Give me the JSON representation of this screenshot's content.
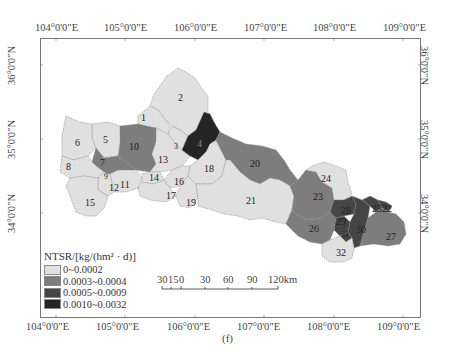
{
  "figure": {
    "caption": "(f)",
    "colors": {
      "class1": "#e0e0e0",
      "class2": "#7d7d7d",
      "class3": "#454545",
      "class4": "#252525",
      "frame": "#777777"
    }
  },
  "axes": {
    "top_lon": [
      "104°0'0\"E",
      "105°0'0\"E",
      "106°0'0\"E",
      "107°0'0\"E",
      "108°0'0\"E",
      "109°0'0\"E"
    ],
    "bottom_lon": [
      "104°0'0\"E",
      "105°0'0\"E",
      "106°0'0\"E",
      "107°0'0\"E",
      "108°0'0\"E",
      "109°0'0\"E"
    ],
    "left_lat": [
      "36°0'0\"N",
      "35°0'0\"N",
      "34°0'0\"N"
    ],
    "right_lat": [
      "36°0'0\"N",
      "35°0'0\"N",
      "34°0'0\"N"
    ]
  },
  "legend": {
    "title": "NTSR/[kg/(hm² · d)]",
    "items": [
      {
        "label": "0~0.0002",
        "color": "#e0e0e0"
      },
      {
        "label": "0.0003~0.0004",
        "color": "#7d7d7d"
      },
      {
        "label": "0.0005~0.0009",
        "color": "#454545"
      },
      {
        "label": "0.0010~0.0032",
        "color": "#252525"
      }
    ]
  },
  "scalebar": {
    "labels": [
      "30",
      "15",
      "0",
      "30",
      "60",
      "90",
      "120km"
    ]
  },
  "regions": [
    {
      "id": "1",
      "class": 1
    },
    {
      "id": "2",
      "class": 1
    },
    {
      "id": "3",
      "class": 1
    },
    {
      "id": "4",
      "class": 4
    },
    {
      "id": "5",
      "class": 1
    },
    {
      "id": "6",
      "class": 1
    },
    {
      "id": "7",
      "class": 2
    },
    {
      "id": "8",
      "class": 1
    },
    {
      "id": "9",
      "class": 3
    },
    {
      "id": "10",
      "class": 2
    },
    {
      "id": "11",
      "class": 1
    },
    {
      "id": "12",
      "class": 1
    },
    {
      "id": "13",
      "class": 1
    },
    {
      "id": "14",
      "class": 1
    },
    {
      "id": "15",
      "class": 1
    },
    {
      "id": "16",
      "class": 1
    },
    {
      "id": "17",
      "class": 1
    },
    {
      "id": "18",
      "class": 1
    },
    {
      "id": "19",
      "class": 1
    },
    {
      "id": "20",
      "class": 2
    },
    {
      "id": "21",
      "class": 1
    },
    {
      "id": "22",
      "class": 3
    },
    {
      "id": "23",
      "class": 2
    },
    {
      "id": "24",
      "class": 1
    },
    {
      "id": "25",
      "class": 3
    },
    {
      "id": "26",
      "class": 2
    },
    {
      "id": "27",
      "class": 2
    },
    {
      "id": "28",
      "class": 3
    },
    {
      "id": "29",
      "class": 3
    },
    {
      "id": "30",
      "class": 3
    },
    {
      "id": "31",
      "class": 3
    },
    {
      "id": "32",
      "class": 1
    }
  ]
}
